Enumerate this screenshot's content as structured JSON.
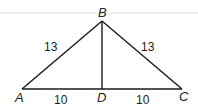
{
  "diagram": {
    "type": "triangle-with-altitude",
    "vertices": {
      "A": {
        "label": "A",
        "x": 22,
        "y": 89
      },
      "B": {
        "label": "B",
        "x": 102,
        "y": 21
      },
      "C": {
        "label": "C",
        "x": 182,
        "y": 89
      },
      "D": {
        "label": "D",
        "x": 102,
        "y": 89
      }
    },
    "segments": [
      {
        "from": "A",
        "to": "B",
        "length_label": "13"
      },
      {
        "from": "B",
        "to": "C",
        "length_label": "13"
      },
      {
        "from": "A",
        "to": "D",
        "length_label": "10"
      },
      {
        "from": "D",
        "to": "C",
        "length_label": "10"
      },
      {
        "from": "B",
        "to": "D",
        "length_label": ""
      }
    ],
    "labels": {
      "A": "A",
      "B": "B",
      "C": "C",
      "D": "D",
      "AB": "13",
      "BC": "13",
      "AD": "10",
      "DC": "10"
    },
    "colors": {
      "line": "#1a1a1a",
      "rule": "#d6d6d6"
    }
  }
}
